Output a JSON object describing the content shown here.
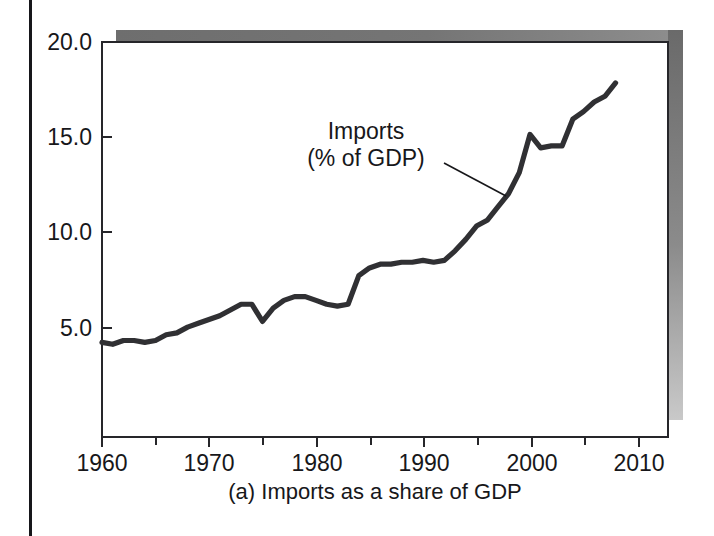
{
  "figure": {
    "caption": "(a) Imports as a share of GDP",
    "annotation": {
      "line1": "Imports",
      "line2": "(% of GDP)"
    }
  },
  "colors": {
    "series_line": "#303033",
    "axis": "#26262a",
    "text": "#17171a",
    "shadow_dark": "#6e6e6e",
    "shadow_light": "#c9c9c9",
    "plot_face": "#ffffff"
  },
  "axes": {
    "y_tick_labels": [
      "20.0",
      "15.0",
      "10.0",
      "5.0"
    ],
    "y_tick_values": [
      20.0,
      15.0,
      10.0,
      5.0
    ],
    "x_tick_labels": [
      "1960",
      "1970",
      "1980",
      "1990",
      "2000",
      "2010"
    ],
    "x_tick_values": [
      1960,
      1970,
      1980,
      1990,
      2000,
      2010
    ],
    "x_minor_ticks": [
      1965,
      1975,
      1985,
      1995,
      2005
    ],
    "x_range": [
      1960,
      2012.9
    ],
    "y_range": [
      -0.76,
      20.0
    ],
    "grid": false
  },
  "chart_data": {
    "type": "line",
    "title": "",
    "subtitle": "",
    "xlabel": "",
    "ylabel": "",
    "caption": "(a) Imports as a share of GDP",
    "series_name": "Imports (% of GDP)",
    "legend": [
      "Imports (% of GDP)"
    ],
    "legend_position": "inline-annotation",
    "annotations": [
      {
        "text": "Imports\n(% of GDP)",
        "points_to_year": 1997,
        "points_to_value": 12.2
      }
    ],
    "xlim": [
      1960,
      2012.9
    ],
    "ylim": [
      -0.76,
      20.0
    ],
    "x": [
      1960,
      1961,
      1962,
      1963,
      1964,
      1965,
      1966,
      1967,
      1968,
      1969,
      1970,
      1971,
      1972,
      1973,
      1974,
      1975,
      1976,
      1977,
      1978,
      1979,
      1980,
      1981,
      1982,
      1983,
      1984,
      1985,
      1986,
      1987,
      1988,
      1989,
      1990,
      1991,
      1992,
      1993,
      1994,
      1995,
      1996,
      1997,
      1998,
      1999,
      2000,
      2001,
      2002,
      2003,
      2004,
      2005,
      2006,
      2007,
      2008
    ],
    "values": [
      4.2,
      4.1,
      4.3,
      4.3,
      4.2,
      4.3,
      4.6,
      4.7,
      5.0,
      5.2,
      5.4,
      5.6,
      5.9,
      6.2,
      6.2,
      5.3,
      6.0,
      6.4,
      6.6,
      6.6,
      6.4,
      6.2,
      6.1,
      6.2,
      7.7,
      8.1,
      8.3,
      8.3,
      8.4,
      8.4,
      8.5,
      8.4,
      8.5,
      9.0,
      9.6,
      10.3,
      10.6,
      11.3,
      12.0,
      13.1,
      15.1,
      14.4,
      14.5,
      14.5,
      15.9,
      16.3,
      16.8,
      17.1,
      17.8
    ],
    "series": [
      {
        "name": "Imports (% of GDP)",
        "values": [
          4.2,
          4.1,
          4.3,
          4.3,
          4.2,
          4.3,
          4.6,
          4.7,
          5.0,
          5.2,
          5.4,
          5.6,
          5.9,
          6.2,
          6.2,
          5.3,
          6.0,
          6.4,
          6.6,
          6.6,
          6.4,
          6.2,
          6.1,
          6.2,
          7.7,
          8.1,
          8.3,
          8.3,
          8.4,
          8.4,
          8.5,
          8.4,
          8.5,
          9.0,
          9.6,
          10.3,
          10.6,
          11.3,
          12.0,
          13.1,
          15.1,
          14.4,
          14.5,
          14.5,
          15.9,
          16.3,
          16.8,
          17.1,
          17.8
        ]
      }
    ]
  }
}
